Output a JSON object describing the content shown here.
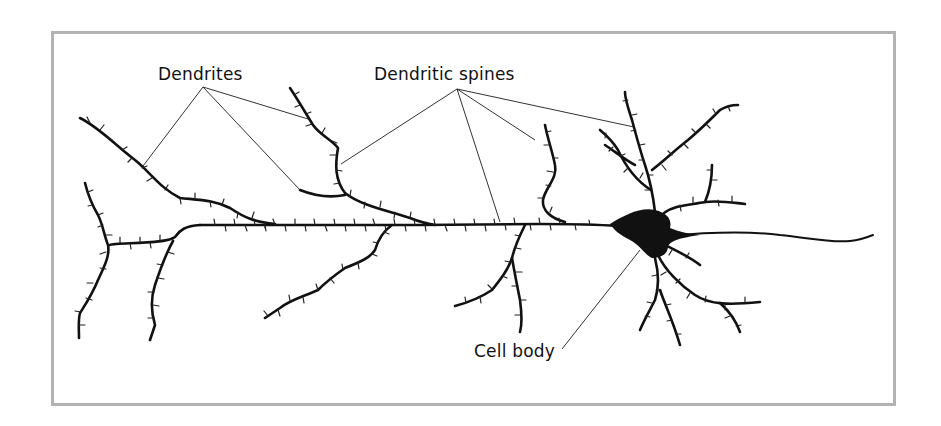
{
  "figure": {
    "labels": {
      "dendrites": "Dendrites",
      "dendritic_spines": "Dendritic spines",
      "cell_body": "Cell body"
    },
    "colors": {
      "frame_border": "#b3b3b3",
      "ink": "#111111",
      "leader_line": "#333333",
      "background": "#ffffff"
    }
  }
}
